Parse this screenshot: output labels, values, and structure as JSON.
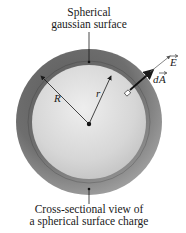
{
  "diagram": {
    "top_label": {
      "line1": "Spherical",
      "line2": "gaussian surface"
    },
    "bottom_label": {
      "line1": "Cross-sectional view of",
      "line2": "a spherical surface charge"
    },
    "symbols": {
      "R": "R",
      "r": "r",
      "E": "E",
      "dA": "dA",
      "d": "d",
      "A": "A"
    },
    "colors": {
      "outer_shell": "#6a6a6a",
      "outer_shell_light": "#9a9a9a",
      "inner_disk": "#d8d8d8",
      "inner_disk_highlight": "#ececec",
      "lines": "#1a1a1a",
      "text": "#1a1a1a"
    },
    "geometry": {
      "center": [
        89,
        122
      ],
      "outer_radius": 73,
      "inner_radius": 57,
      "gaussian_radius": 61
    }
  }
}
